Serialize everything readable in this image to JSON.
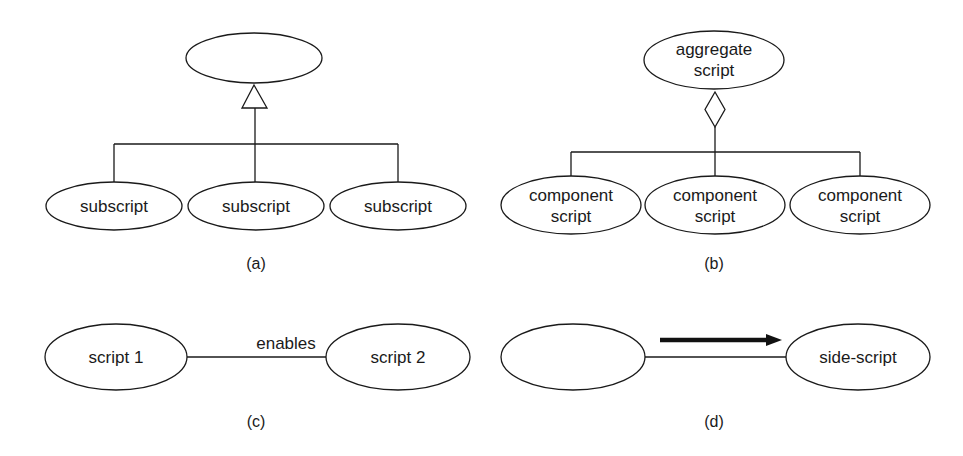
{
  "panels": {
    "a": {
      "caption": "(a)",
      "parent_label": "",
      "children": [
        "subscript",
        "subscript",
        "subscript"
      ],
      "relation": "generalization (hollow triangle)"
    },
    "b": {
      "caption": "(b)",
      "parent_label_line1": "aggregate",
      "parent_label_line2": "script",
      "children": [
        {
          "line1": "component",
          "line2": "script"
        },
        {
          "line1": "component",
          "line2": "script"
        },
        {
          "line1": "component",
          "line2": "script"
        }
      ],
      "relation": "aggregation (hollow diamond)"
    },
    "c": {
      "caption": "(c)",
      "left_label": "script 1",
      "right_label": "script 2",
      "edge_label": "enables"
    },
    "d": {
      "caption": "(d)",
      "left_label": "",
      "right_label": "side-script",
      "arrow_direction": "right"
    }
  },
  "colors": {
    "stroke": "#1a1a1a",
    "background": "#ffffff"
  }
}
